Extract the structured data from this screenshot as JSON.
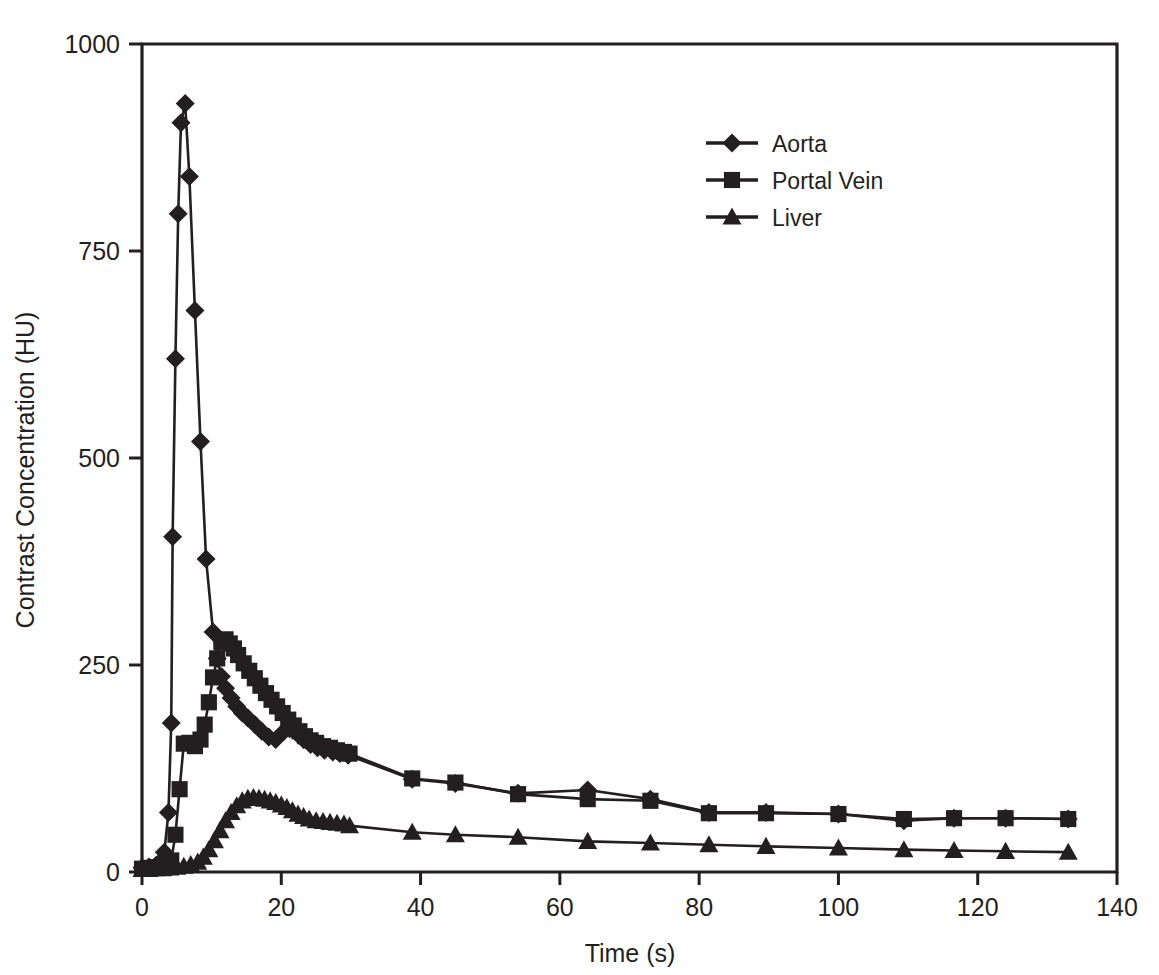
{
  "chart_data": {
    "type": "line",
    "title": "",
    "xlabel": "Time (s)",
    "ylabel": "Contrast Concentration (HU)",
    "xlim": [
      0,
      140
    ],
    "ylim": [
      0,
      1000
    ],
    "xticks": [
      0,
      20,
      40,
      60,
      80,
      100,
      120,
      140
    ],
    "yticks": [
      0,
      250,
      500,
      750,
      1000
    ],
    "xtick_labels": [
      "0",
      "20",
      "40",
      "60",
      "80",
      "100",
      "120",
      "140"
    ],
    "ytick_labels": [
      "0",
      "250",
      "500",
      "750",
      "1000"
    ],
    "grid": false,
    "legend_position": "upper-center",
    "series": [
      {
        "name": "Aorta",
        "marker": "diamond",
        "color": "#231f20",
        "points": [
          [
            0.0,
            5
          ],
          [
            1.0,
            6
          ],
          [
            2.0,
            8
          ],
          [
            2.6,
            12
          ],
          [
            3.2,
            24
          ],
          [
            3.8,
            72
          ],
          [
            4.2,
            180
          ],
          [
            4.4,
            405
          ],
          [
            4.8,
            620
          ],
          [
            5.2,
            795
          ],
          [
            5.6,
            905
          ],
          [
            6.2,
            928
          ],
          [
            6.8,
            840
          ],
          [
            7.6,
            678
          ],
          [
            8.4,
            520
          ],
          [
            9.2,
            378
          ],
          [
            10.2,
            290
          ],
          [
            10.8,
            258
          ],
          [
            11.4,
            236
          ],
          [
            12.0,
            222
          ],
          [
            12.8,
            210
          ],
          [
            13.6,
            200
          ],
          [
            14.4,
            192
          ],
          [
            15.2,
            186
          ],
          [
            16.2,
            178
          ],
          [
            17.2,
            170
          ],
          [
            18.2,
            163
          ],
          [
            19.2,
            160
          ],
          [
            20.4,
            170
          ],
          [
            21.2,
            173
          ],
          [
            22.2,
            168
          ],
          [
            23.2,
            160
          ],
          [
            24.2,
            154
          ],
          [
            25.2,
            150
          ],
          [
            26.2,
            147
          ],
          [
            27.4,
            145
          ],
          [
            28.4,
            143
          ],
          [
            29.6,
            141
          ],
          [
            38.8,
            112
          ],
          [
            45.0,
            107
          ],
          [
            54.0,
            95
          ],
          [
            64.0,
            99
          ],
          [
            73.0,
            88
          ],
          [
            81.4,
            72
          ],
          [
            89.6,
            72
          ],
          [
            100.0,
            70
          ],
          [
            109.4,
            62
          ],
          [
            116.6,
            65
          ],
          [
            124.0,
            65
          ],
          [
            133.0,
            64
          ]
        ]
      },
      {
        "name": "Portal Vein",
        "marker": "square",
        "color": "#231f20",
        "points": [
          [
            0.0,
            4
          ],
          [
            1.0,
            5
          ],
          [
            2.0,
            6
          ],
          [
            3.0,
            7
          ],
          [
            3.6,
            9
          ],
          [
            4.2,
            14
          ],
          [
            4.8,
            45
          ],
          [
            5.4,
            100
          ],
          [
            6.0,
            155
          ],
          [
            6.8,
            156
          ],
          [
            7.6,
            152
          ],
          [
            8.4,
            160
          ],
          [
            9.0,
            178
          ],
          [
            9.6,
            205
          ],
          [
            10.2,
            235
          ],
          [
            10.8,
            258
          ],
          [
            11.4,
            278
          ],
          [
            12.0,
            281
          ],
          [
            12.6,
            276
          ],
          [
            13.2,
            270
          ],
          [
            13.8,
            262
          ],
          [
            14.6,
            252
          ],
          [
            15.4,
            243
          ],
          [
            16.2,
            234
          ],
          [
            17.0,
            225
          ],
          [
            17.8,
            216
          ],
          [
            18.6,
            208
          ],
          [
            19.4,
            200
          ],
          [
            20.2,
            192
          ],
          [
            21.0,
            184
          ],
          [
            21.8,
            177
          ],
          [
            22.6,
            170
          ],
          [
            23.4,
            164
          ],
          [
            24.2,
            159
          ],
          [
            25.0,
            156
          ],
          [
            26.0,
            152
          ],
          [
            27.0,
            150
          ],
          [
            28.0,
            147
          ],
          [
            29.0,
            145
          ],
          [
            29.8,
            143
          ],
          [
            38.8,
            113
          ],
          [
            45.0,
            108
          ],
          [
            54.0,
            94
          ],
          [
            64.0,
            88
          ],
          [
            73.0,
            86
          ],
          [
            81.4,
            71
          ],
          [
            89.6,
            71
          ],
          [
            100.0,
            70
          ],
          [
            109.4,
            64
          ],
          [
            116.6,
            65
          ],
          [
            124.0,
            65
          ],
          [
            133.0,
            64
          ]
        ]
      },
      {
        "name": "Liver",
        "marker": "triangle",
        "color": "#231f20",
        "points": [
          [
            0.0,
            3
          ],
          [
            1.0,
            3
          ],
          [
            2.0,
            4
          ],
          [
            3.0,
            4
          ],
          [
            4.0,
            5
          ],
          [
            5.0,
            6
          ],
          [
            6.0,
            7
          ],
          [
            7.0,
            9
          ],
          [
            8.0,
            12
          ],
          [
            8.8,
            18
          ],
          [
            9.6,
            27
          ],
          [
            10.4,
            38
          ],
          [
            11.2,
            50
          ],
          [
            12.0,
            62
          ],
          [
            12.8,
            72
          ],
          [
            13.6,
            80
          ],
          [
            14.4,
            86
          ],
          [
            15.2,
            89
          ],
          [
            16.0,
            90
          ],
          [
            16.8,
            89
          ],
          [
            17.6,
            88
          ],
          [
            18.4,
            86
          ],
          [
            19.2,
            84
          ],
          [
            20.0,
            81
          ],
          [
            20.8,
            78
          ],
          [
            21.6,
            74
          ],
          [
            22.4,
            70
          ],
          [
            23.2,
            67
          ],
          [
            24.0,
            64
          ],
          [
            25.0,
            62
          ],
          [
            26.0,
            61
          ],
          [
            27.0,
            60
          ],
          [
            28.0,
            59
          ],
          [
            29.0,
            58
          ],
          [
            29.8,
            56
          ],
          [
            38.8,
            48
          ],
          [
            45.0,
            45
          ],
          [
            54.0,
            42
          ],
          [
            64.0,
            37
          ],
          [
            73.0,
            35
          ],
          [
            81.4,
            33
          ],
          [
            89.6,
            31
          ],
          [
            100.0,
            29
          ],
          [
            109.4,
            27
          ],
          [
            116.6,
            26
          ],
          [
            124.0,
            25
          ],
          [
            133.0,
            24
          ]
        ]
      }
    ],
    "annotations": []
  },
  "legend": {
    "entries": [
      {
        "label": "Aorta",
        "marker": "diamond"
      },
      {
        "label": "Portal Vein",
        "marker": "square"
      },
      {
        "label": "Liver",
        "marker": "triangle"
      }
    ]
  },
  "axes": {
    "x_title": "Time (s)",
    "y_title": "Contrast Concentration (HU)"
  }
}
